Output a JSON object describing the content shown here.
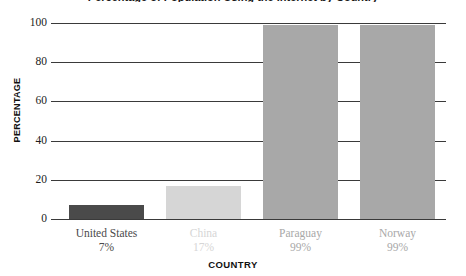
{
  "chart_data": {
    "type": "bar",
    "title": "Percentage of Population Using the Internet by Country",
    "xlabel": "COUNTRY",
    "ylabel": "PERCENTAGE",
    "categories": [
      "United States",
      "China",
      "Paraguay",
      "Norway"
    ],
    "values": [
      7,
      17,
      99,
      99
    ],
    "value_labels": [
      "7%",
      "17%",
      "99%",
      "99%"
    ],
    "ylim": [
      0,
      100
    ],
    "yticks": [
      0,
      20,
      40,
      60,
      80,
      100
    ],
    "ytick_labels": [
      "0",
      "20",
      "40",
      "60",
      "80",
      "100"
    ],
    "grid": true,
    "legend": "none",
    "bar_colors": [
      "#4a4a4a",
      "#d6d6d6",
      "#a8a8a8",
      "#a8a8a8"
    ],
    "label_colors": [
      "#4a4a4a",
      "#d6d6d6",
      "#a8a8a8",
      "#a8a8a8"
    ],
    "grid_color": "#3a3a3a",
    "axis_text_color": "#1c1c1c",
    "axis_title_color": "#111111"
  }
}
